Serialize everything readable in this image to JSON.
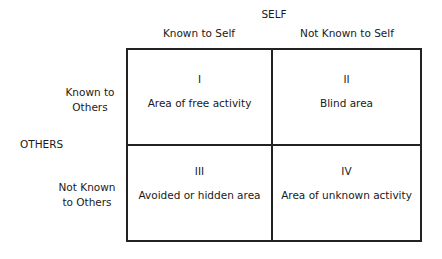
{
  "diagram": {
    "top_axis": {
      "label": "SELF",
      "columns": [
        "Known to Self",
        "Not Known to Self"
      ]
    },
    "left_axis": {
      "label": "OTHERS",
      "rows": [
        "Known to Others",
        "Not Known to Others"
      ]
    },
    "row_labels": {
      "row1_line1": "Known to",
      "row1_line2": "Others",
      "row2_line1": "Not Known",
      "row2_line2": "to Others"
    },
    "cells": [
      {
        "numeral": "I",
        "text": "Area of free activity"
      },
      {
        "numeral": "II",
        "text": "Blind area"
      },
      {
        "numeral": "III",
        "text": "Avoided or hidden area"
      },
      {
        "numeral": "IV",
        "text": "Area of unknown activity"
      }
    ]
  }
}
